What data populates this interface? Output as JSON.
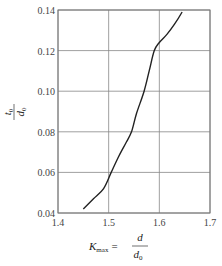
{
  "chart_data": {
    "type": "line",
    "title": "",
    "xlabel": "K_max = d / d0",
    "ylabel": "t0 / d0",
    "xlim": [
      1.4,
      1.7
    ],
    "ylim": [
      0.04,
      0.14
    ],
    "grid": true,
    "legend": null,
    "x_ticks": [
      "1.4",
      "1.5",
      "1.6",
      "1.7"
    ],
    "y_ticks": [
      "0.04",
      "0.06",
      "0.08",
      "0.10",
      "0.12",
      "0.14"
    ],
    "series": [
      {
        "name": "t0/d0 vs Kmax",
        "x": [
          1.45,
          1.47,
          1.49,
          1.505,
          1.52,
          1.535,
          1.545,
          1.555,
          1.57,
          1.58,
          1.59,
          1.6,
          1.615,
          1.63,
          1.645
        ],
        "y": [
          0.042,
          0.047,
          0.052,
          0.06,
          0.068,
          0.075,
          0.08,
          0.089,
          0.1,
          0.11,
          0.12,
          0.124,
          0.128,
          0.133,
          0.139
        ]
      }
    ]
  },
  "labels": {
    "x_axis_K": "K",
    "x_axis_K_sub": "max",
    "x_axis_eq": "=",
    "x_axis_num": "d",
    "x_axis_den": "d",
    "x_axis_den_sub": "0",
    "y_axis_num": "t",
    "y_axis_num_sub": "0",
    "y_axis_den": "d",
    "y_axis_den_sub": "0"
  },
  "colors": {
    "curve": "#222222",
    "grid": "#888888",
    "frame": "#777777"
  }
}
